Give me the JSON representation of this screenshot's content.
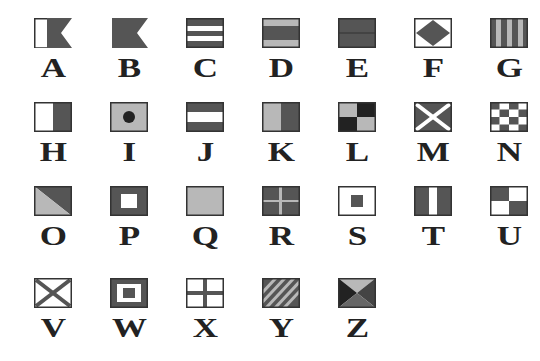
{
  "colors": {
    "dark": "#555555",
    "light": "#b8b8b8",
    "white": "#ffffff",
    "black": "#222222",
    "outline": "#333333"
  },
  "flags": [
    {
      "letter": "A",
      "pattern": "swallow-white-dark"
    },
    {
      "letter": "B",
      "pattern": "swallow-dark"
    },
    {
      "letter": "C",
      "pattern": "horizontal-dark-white-dark-white-dark"
    },
    {
      "letter": "D",
      "pattern": "horizontal-light-dark-light"
    },
    {
      "letter": "E",
      "pattern": "horizontal-dark-dark"
    },
    {
      "letter": "F",
      "pattern": "diamond-dark-on-white"
    },
    {
      "letter": "G",
      "pattern": "vertical-stripes-dark-light"
    },
    {
      "letter": "H",
      "pattern": "vertical-white-dark"
    },
    {
      "letter": "I",
      "pattern": "dot-dark-on-light"
    },
    {
      "letter": "J",
      "pattern": "horizontal-dark-white-dark"
    },
    {
      "letter": "K",
      "pattern": "vertical-light-dark"
    },
    {
      "letter": "L",
      "pattern": "quarters-light-dark"
    },
    {
      "letter": "M",
      "pattern": "saltire-white-on-dark"
    },
    {
      "letter": "N",
      "pattern": "checker-dark-white"
    },
    {
      "letter": "O",
      "pattern": "diagonal-dark-light"
    },
    {
      "letter": "P",
      "pattern": "square-white-on-dark"
    },
    {
      "letter": "Q",
      "pattern": "plain-light"
    },
    {
      "letter": "R",
      "pattern": "cross-light-on-dark"
    },
    {
      "letter": "S",
      "pattern": "square-dark-on-white"
    },
    {
      "letter": "T",
      "pattern": "vertical-dark-white-dark"
    },
    {
      "letter": "U",
      "pattern": "quarters-dark-white"
    },
    {
      "letter": "V",
      "pattern": "saltire-dark-on-white"
    },
    {
      "letter": "W",
      "pattern": "nested-squares"
    },
    {
      "letter": "X",
      "pattern": "cross-dark-on-white"
    },
    {
      "letter": "Y",
      "pattern": "diagonal-stripes"
    },
    {
      "letter": "Z",
      "pattern": "triangles"
    }
  ]
}
